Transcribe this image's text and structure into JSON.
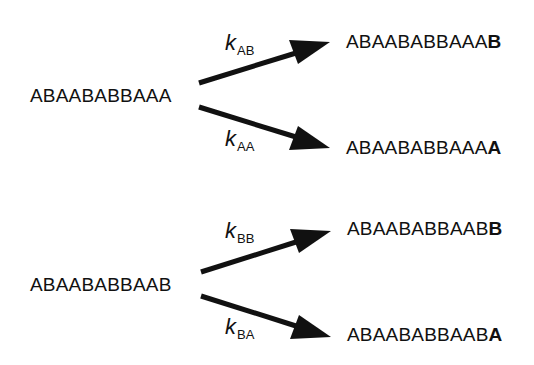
{
  "diagram": {
    "type": "reaction-scheme",
    "groups": [
      {
        "source": "ABAABABBAAA",
        "branches": [
          {
            "rate_symbol": "k",
            "rate_subscript": "AB",
            "product_prefix": "ABAABABBAAA",
            "product_added": "B"
          },
          {
            "rate_symbol": "k",
            "rate_subscript": "AA",
            "product_prefix": "ABAABABBAAA",
            "product_added": "A"
          }
        ]
      },
      {
        "source": "ABAABABBAAB",
        "branches": [
          {
            "rate_symbol": "k",
            "rate_subscript": "BB",
            "product_prefix": "ABAABABBAAB",
            "product_added": "B"
          },
          {
            "rate_symbol": "k",
            "rate_subscript": "BA",
            "product_prefix": "ABAABABBAAB",
            "product_added": "A"
          }
        ]
      }
    ],
    "colors": {
      "text": "#111111",
      "arrow": "#111111",
      "background": "#ffffff"
    }
  }
}
